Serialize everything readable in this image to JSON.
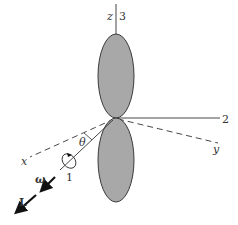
{
  "diagram": {
    "type": "rigid-rotor-dumbbell",
    "colors": {
      "lobe_fill": "#a8a8a8",
      "lobe_stroke": "#3a3a3a",
      "line": "#333333",
      "background": "#ffffff"
    },
    "labels": {
      "z_axis": "z",
      "axis_3": "3",
      "axis_2": "2",
      "y_axis": "y",
      "x_axis": "x",
      "axis_1": "1",
      "angle": "θ",
      "angular_velocity": "ω",
      "angular_momentum": "L"
    }
  }
}
